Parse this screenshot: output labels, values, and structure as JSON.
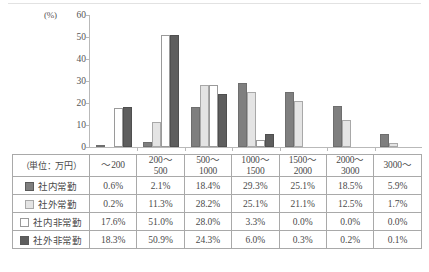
{
  "chart_data": {
    "type": "bar",
    "title": "",
    "xlabel": "",
    "ylabel": "(%)",
    "ylim": [
      0,
      60
    ],
    "yticks": [
      0,
      10,
      20,
      30,
      40,
      50,
      60
    ],
    "grid": false,
    "legend_position": "table-left",
    "unit_note": "（単位：万円）",
    "categories": [
      "～200",
      "200～500",
      "500～1000",
      "1000～1500",
      "1500～2000",
      "2000～3000",
      "3000～"
    ],
    "category_lines": [
      {
        "l1": "～200",
        "l2": ""
      },
      {
        "l1": "200～",
        "l2": "500"
      },
      {
        "l1": "500～",
        "l2": "1000"
      },
      {
        "l1": "1000～",
        "l2": "1500"
      },
      {
        "l1": "1500～",
        "l2": "2000"
      },
      {
        "l1": "2000～",
        "l2": "3000"
      },
      {
        "l1": "3000～",
        "l2": ""
      }
    ],
    "series": [
      {
        "name": "社内常勤",
        "color": "#7f7f7f",
        "values": [
          0.6,
          2.1,
          18.4,
          29.3,
          25.1,
          18.5,
          5.9
        ],
        "display": [
          "0.6%",
          "2.1%",
          "18.4%",
          "29.3%",
          "25.1%",
          "18.5%",
          "5.9%"
        ]
      },
      {
        "name": "社外常勤",
        "color": "#e4e4e4",
        "values": [
          0.2,
          11.3,
          28.2,
          25.1,
          21.1,
          12.5,
          1.7
        ],
        "display": [
          "0.2%",
          "11.3%",
          "28.2%",
          "25.1%",
          "21.1%",
          "12.5%",
          "1.7%"
        ]
      },
      {
        "name": "社内非常勤",
        "color": "#ffffff",
        "values": [
          17.6,
          51.0,
          28.0,
          3.3,
          0.0,
          0.0,
          0.0
        ],
        "display": [
          "17.6%",
          "51.0%",
          "28.0%",
          "3.3%",
          "0.0%",
          "0.0%",
          "0.0%"
        ]
      },
      {
        "name": "社外非常勤",
        "color": "#5e5e5e",
        "values": [
          18.3,
          50.9,
          24.3,
          6.0,
          0.3,
          0.2,
          0.1
        ],
        "display": [
          "18.3%",
          "50.9%",
          "24.3%",
          "6.0%",
          "0.3%",
          "0.2%",
          "0.1%"
        ]
      }
    ]
  },
  "axis": {
    "unit_label": "(%)",
    "ticks": [
      "60",
      "50",
      "40",
      "30",
      "20",
      "10",
      "0"
    ]
  },
  "table": {
    "corner_label": "（単位：万円）"
  }
}
